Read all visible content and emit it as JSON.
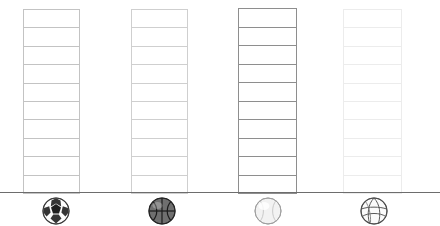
{
  "chart_data": {
    "type": "bar",
    "title": "",
    "subtitle": "",
    "xlabel": "",
    "ylabel": "",
    "grid": false,
    "legend": "none",
    "segmented": true,
    "segments_per_bar": 10,
    "ylim": [
      0,
      10
    ],
    "categories": [
      "Soccer Ball",
      "Basketball",
      "Baseball",
      "Volleyball"
    ],
    "tick_labels": [],
    "values": [
      10,
      10,
      10,
      10
    ],
    "series": [
      {
        "name": "Units",
        "values": [
          10,
          10,
          10,
          10
        ]
      }
    ],
    "annotations": []
  },
  "bars": [
    {
      "id": "bar-soccer",
      "label": "Soccer Ball",
      "segments": 10,
      "value": 10,
      "left": 23,
      "width": 57,
      "top": 7,
      "stroke": "#c3c3c3",
      "fill": "#ffffff"
    },
    {
      "id": "bar-basketball",
      "label": "Basketball",
      "segments": 10,
      "value": 10,
      "left": 131,
      "width": 57,
      "top": 7,
      "stroke": "#cfcfcf",
      "fill": "#ffffff"
    },
    {
      "id": "bar-baseball",
      "label": "Baseball",
      "segments": 10,
      "value": 10,
      "left": 238,
      "width": 59,
      "top": 6,
      "stroke": "#8e8e8e",
      "fill": "#ffffff"
    },
    {
      "id": "bar-volleyball",
      "label": "Volleyball",
      "segments": 10,
      "value": 10,
      "left": 343,
      "width": 59,
      "top": 7,
      "stroke": "#ececec",
      "fill": "#ffffff"
    }
  ],
  "baseline": {
    "color": "#6d6d6d",
    "label": "ground-line"
  },
  "icons": [
    {
      "id": "soccer-ball-icon",
      "name": "Soccer Ball",
      "left": 41,
      "accent": "#1f1f1f"
    },
    {
      "id": "basketball-icon",
      "name": "Basketball",
      "left": 147,
      "accent": "#555555"
    },
    {
      "id": "baseball-icon",
      "name": "Baseball",
      "left": 253,
      "accent": "#b8b8b8"
    },
    {
      "id": "volleyball-icon",
      "name": "Volleyball",
      "left": 359,
      "accent": "#7a7a7a"
    }
  ],
  "colors": {
    "background": "#ffffff",
    "baseline": "#6d6d6d",
    "bar_stroke_dark": "#8e8e8e",
    "bar_stroke_light": "#ececec"
  }
}
